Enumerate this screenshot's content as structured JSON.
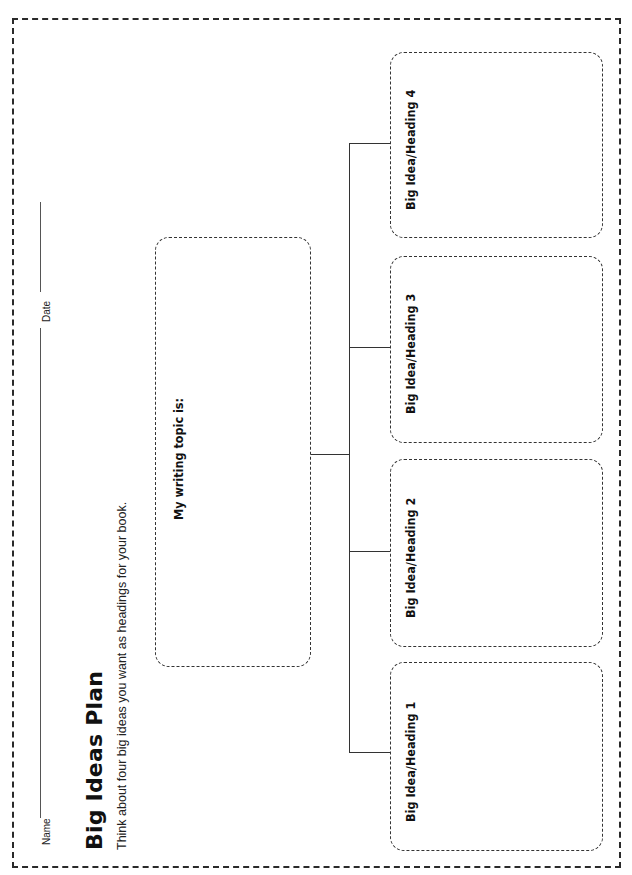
{
  "worksheet": {
    "title": "Big Ideas Plan",
    "subtitle": "Think about four big ideas you want as headings for your book.",
    "fields": {
      "name_label": "Name",
      "date_label": "Date"
    },
    "topic_box": {
      "label": "My writing topic is:"
    },
    "idea_boxes": [
      {
        "label": "Big Idea/Heading 1"
      },
      {
        "label": "Big Idea/Heading 2"
      },
      {
        "label": "Big Idea/Heading 3"
      },
      {
        "label": "Big Idea/Heading 4"
      }
    ],
    "colors": {
      "border": "#2a2a2a",
      "text": "#111111",
      "background": "#ffffff"
    }
  }
}
